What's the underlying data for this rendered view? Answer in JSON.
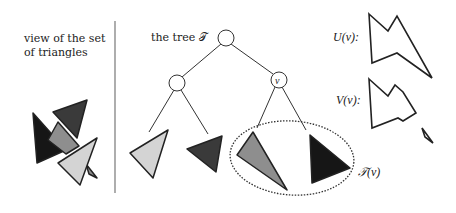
{
  "left_panel": {
    "caption_line1": "view of the set",
    "caption_line2": "of triangles"
  },
  "tree": {
    "title": "the tree 𝒯",
    "node_label_nu": "ν"
  },
  "labels": {
    "U": "U(ν):",
    "V": "V(ν):",
    "T": "𝒯(ν)"
  },
  "colors": {
    "light_gray": "#d4d4d4",
    "mid_gray": "#8e8e8e",
    "dark_gray": "#3a3a3a",
    "black": "#161616",
    "stroke": "#222222"
  }
}
